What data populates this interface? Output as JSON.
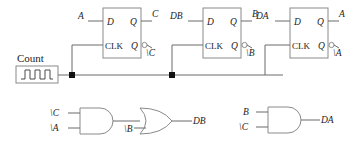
{
  "diagram": {
    "colors": {
      "wire": "#6b6b6b",
      "outline": "#8a8a8a",
      "text": "#222222",
      "junction": "#111111",
      "background": "#ffffff"
    },
    "clock_source": {
      "label": "Count",
      "icon": "clock-waveform-icon"
    },
    "flipflops": [
      {
        "id": "ff-c",
        "pins": {
          "d": "D",
          "clk": "CLK",
          "q": "Q",
          "qbar": "Q"
        },
        "input_label": "A",
        "q_label": "C",
        "qbar_label": "\\C"
      },
      {
        "id": "ff-b",
        "pins": {
          "d": "D",
          "clk": "CLK",
          "q": "Q",
          "qbar": "Q"
        },
        "input_label": "DB",
        "q_label": "B",
        "qbar_label": "\\B"
      },
      {
        "id": "ff-a",
        "pins": {
          "d": "D",
          "clk": "CLK",
          "q": "Q",
          "qbar": "Q"
        },
        "input_label": "DA",
        "q_label": "A",
        "qbar_label": "\\A"
      }
    ],
    "gates": [
      {
        "id": "and-db",
        "type": "and",
        "inputs": [
          "\\C",
          "\\A"
        ],
        "output_label": ""
      },
      {
        "id": "or-db",
        "type": "or",
        "inputs": [
          "",
          "\\B"
        ],
        "output_label": "DB"
      },
      {
        "id": "and-da",
        "type": "and",
        "inputs": [
          "B",
          "\\C"
        ],
        "output_label": "DA"
      }
    ]
  }
}
